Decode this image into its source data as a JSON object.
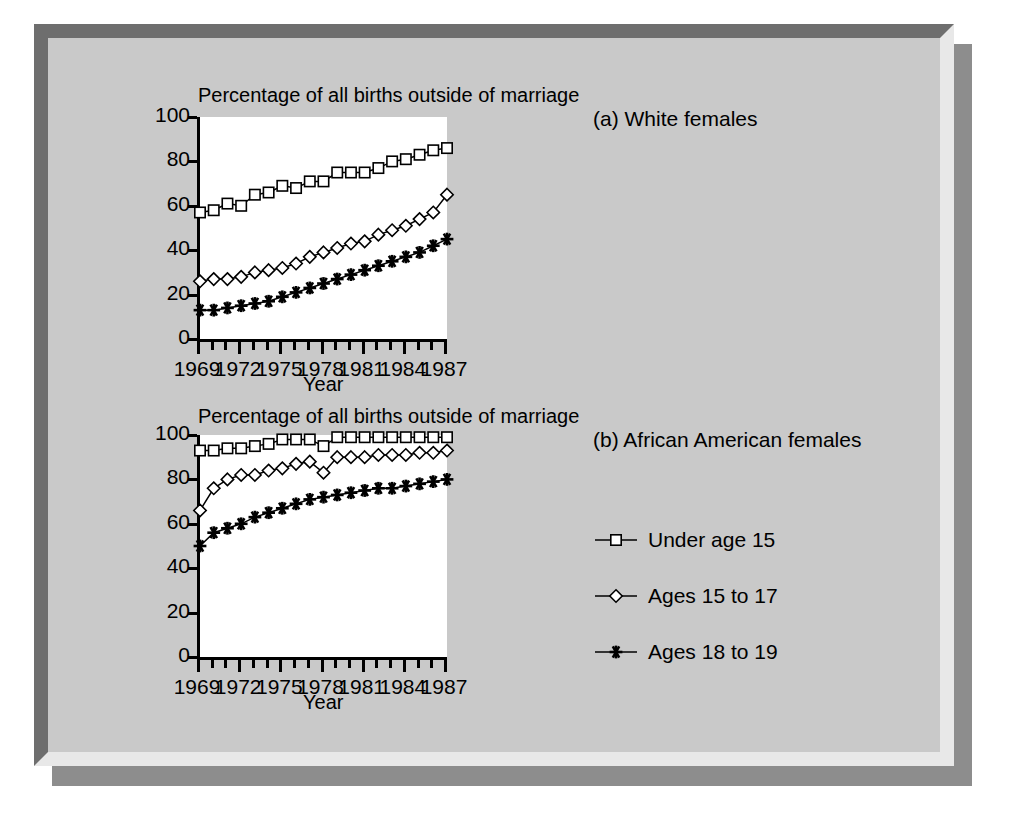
{
  "figure": {
    "background_color": "#c9c9c9",
    "frame_style": "raised-bevel-with-shadow"
  },
  "legend": {
    "position": "bottom-right",
    "items": [
      {
        "label": "Under age 15",
        "marker": "square-marker-icon"
      },
      {
        "label": "Ages 15 to 17",
        "marker": "diamond-marker-icon"
      },
      {
        "label": "Ages 18 to 19",
        "marker": "star-marker-icon"
      }
    ]
  },
  "chart_data": [
    {
      "type": "line",
      "title": "Percentage of all births outside of marriage",
      "panel_label": "(a) White females",
      "xlabel": "Year",
      "ylabel": "",
      "xlim": [
        1969,
        1987
      ],
      "ylim": [
        0,
        100
      ],
      "ytick_labels": [
        "0",
        "20",
        "40",
        "60",
        "80",
        "100"
      ],
      "yticks": [
        0,
        20,
        40,
        60,
        80,
        100
      ],
      "xtick_labels": [
        "1969",
        "1972",
        "1975",
        "1978",
        "1981",
        "1984",
        "1987"
      ],
      "xticks": [
        1969,
        1972,
        1975,
        1978,
        1981,
        1984,
        1987
      ],
      "grid": false,
      "x": [
        1969,
        1970,
        1971,
        1972,
        1973,
        1974,
        1975,
        1976,
        1977,
        1978,
        1979,
        1980,
        1981,
        1982,
        1983,
        1984,
        1985,
        1986,
        1987
      ],
      "series": [
        {
          "name": "Under age 15",
          "marker": "square",
          "values": [
            57,
            58,
            61,
            60,
            65,
            66,
            69,
            68,
            71,
            71,
            75,
            75,
            75,
            77,
            80,
            81,
            83,
            85,
            86
          ]
        },
        {
          "name": "Ages 15 to 17",
          "marker": "diamond",
          "values": [
            26,
            27,
            27,
            28,
            30,
            31,
            32,
            34,
            37,
            39,
            41,
            43,
            44,
            47,
            49,
            51,
            54,
            57,
            65
          ]
        },
        {
          "name": "Ages 18 to 19",
          "marker": "star",
          "values": [
            13,
            13,
            14,
            15,
            16,
            17,
            19,
            21,
            23,
            25,
            27,
            29,
            31,
            33,
            35,
            37,
            39,
            42,
            45
          ]
        }
      ]
    },
    {
      "type": "line",
      "title": "Percentage of all births outside of marriage",
      "panel_label": "(b) African American females",
      "xlabel": "Year",
      "ylabel": "",
      "xlim": [
        1969,
        1987
      ],
      "ylim": [
        0,
        100
      ],
      "ytick_labels": [
        "0",
        "20",
        "40",
        "60",
        "80",
        "100"
      ],
      "yticks": [
        0,
        20,
        40,
        60,
        80,
        100
      ],
      "xtick_labels": [
        "1969",
        "1972",
        "1975",
        "1978",
        "1981",
        "1984",
        "1987"
      ],
      "xticks": [
        1969,
        1972,
        1975,
        1978,
        1981,
        1984,
        1987
      ],
      "grid": false,
      "x": [
        1969,
        1970,
        1971,
        1972,
        1973,
        1974,
        1975,
        1976,
        1977,
        1978,
        1979,
        1980,
        1981,
        1982,
        1983,
        1984,
        1985,
        1986,
        1987
      ],
      "series": [
        {
          "name": "Under age 15",
          "marker": "square",
          "values": [
            93,
            93,
            94,
            94,
            95,
            96,
            98,
            98,
            98,
            95,
            99,
            99,
            99,
            99,
            99,
            99,
            99,
            99,
            99
          ]
        },
        {
          "name": "Ages 15 to 17",
          "marker": "diamond",
          "values": [
            66,
            76,
            80,
            82,
            82,
            84,
            85,
            87,
            88,
            83,
            90,
            90,
            90,
            91,
            91,
            91,
            92,
            92,
            93
          ]
        },
        {
          "name": "Ages 18 to 19",
          "marker": "star",
          "values": [
            50,
            56,
            58,
            60,
            63,
            65,
            67,
            69,
            71,
            72,
            73,
            74,
            75,
            76,
            76,
            77,
            78,
            79,
            80
          ]
        }
      ]
    }
  ]
}
